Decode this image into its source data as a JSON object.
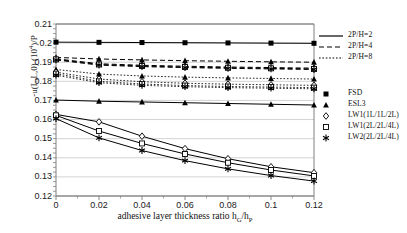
{
  "chart_data": {
    "type": "line",
    "title": "",
    "xlabel": "adhesive layer thickness ratio hG/hP",
    "ylabel": "-u(L,L,0) (10^4)/P",
    "x": [
      0,
      0.02,
      0.04,
      0.06,
      0.08,
      0.1,
      0.12
    ],
    "xlim": [
      0,
      0.12
    ],
    "ylim": [
      0.12,
      0.21
    ],
    "xticks": [
      "0",
      "0.02",
      "0.04",
      "0.06",
      "0.08",
      "0.1",
      "0.12"
    ],
    "yticks": [
      "0.21",
      "0.2",
      "0.19",
      "0.18",
      "0.17",
      "0.16",
      "0.15",
      "0.14",
      "0.13",
      "0.12"
    ],
    "grid": true,
    "legend_position": "right",
    "linestyles": [
      {
        "name": "2P/H=2",
        "dash": "solid"
      },
      {
        "name": "2P/H=4",
        "dash": "dashed"
      },
      {
        "name": "2P/H=8",
        "dash": "dotted"
      }
    ],
    "markers": [
      {
        "name": "FSD",
        "symbol": "square-filled"
      },
      {
        "name": "ESL3",
        "symbol": "triangle-filled"
      },
      {
        "name": "LW1(1L/1L/2L)",
        "symbol": "diamond-open"
      },
      {
        "name": "LW1(2L/2L/4L)",
        "symbol": "square-open"
      },
      {
        "name": "LW2(2L/2L/4L)",
        "symbol": "asterisk"
      }
    ],
    "series": [
      {
        "name": "FSD 2P/H=2",
        "dash": "solid",
        "marker": "square-filled",
        "values": [
          0.2005,
          0.2004,
          0.2003,
          0.2002,
          0.2001,
          0.2,
          0.1999
        ]
      },
      {
        "name": "ESL3 2P/H=4",
        "dash": "dashed",
        "marker": "triangle-filled",
        "values": [
          0.1925,
          0.1917,
          0.1912,
          0.1908,
          0.1905,
          0.1902,
          0.19
        ]
      },
      {
        "name": "LW1(1L/1L/2L) 2P/H=4",
        "dash": "dashed",
        "marker": "diamond-open",
        "values": [
          0.1918,
          0.1892,
          0.1884,
          0.1879,
          0.1875,
          0.1872,
          0.1869
        ]
      },
      {
        "name": "LW1(2L/2L/4L) 2P/H=4",
        "dash": "dashed",
        "marker": "square-open",
        "values": [
          0.1915,
          0.1888,
          0.188,
          0.1875,
          0.1871,
          0.1868,
          0.1865
        ]
      },
      {
        "name": "LW2(2L/2L/4L) 2P/H=4",
        "dash": "dashed",
        "marker": "asterisk",
        "values": [
          0.1912,
          0.1885,
          0.1877,
          0.1872,
          0.1868,
          0.1865,
          0.1862
        ]
      },
      {
        "name": "ESL3 2P/H=8",
        "dash": "dotted",
        "marker": "triangle-filled",
        "values": [
          0.1862,
          0.1838,
          0.1828,
          0.1822,
          0.1818,
          0.1815,
          0.1812
        ]
      },
      {
        "name": "LW1(1L/1L/2L) 2P/H=8",
        "dash": "dotted",
        "marker": "diamond-open",
        "values": [
          0.1848,
          0.1812,
          0.1798,
          0.179,
          0.1785,
          0.1782,
          0.1779
        ]
      },
      {
        "name": "LW1(2L/2L/4L) 2P/H=8",
        "dash": "dotted",
        "marker": "square-open",
        "values": [
          0.184,
          0.18,
          0.1786,
          0.1778,
          0.1773,
          0.177,
          0.1767
        ]
      },
      {
        "name": "LW2(2L/2L/4L) 2P/H=8",
        "dash": "dotted",
        "marker": "asterisk",
        "values": [
          0.1832,
          0.1793,
          0.1779,
          0.1772,
          0.1767,
          0.1764,
          0.1761
        ]
      },
      {
        "name": "ESL3 2P/H=2 lower",
        "dash": "solid",
        "marker": "triangle-filled",
        "values": [
          0.1702,
          0.1696,
          0.1692,
          0.1688,
          0.1684,
          0.168,
          0.1676
        ]
      },
      {
        "name": "LW1(1L/1L/2L) 2P/H=2",
        "dash": "solid",
        "marker": "diamond-open",
        "values": [
          0.1627,
          0.1588,
          0.1513,
          0.1448,
          0.1395,
          0.1353,
          0.1322
        ]
      },
      {
        "name": "LW1(2L/2L/4L) 2P/H=2",
        "dash": "solid",
        "marker": "square-open",
        "values": [
          0.1622,
          0.154,
          0.1475,
          0.142,
          0.1374,
          0.1336,
          0.1305
        ]
      },
      {
        "name": "LW2(2L/2L/4L) 2P/H=2",
        "dash": "solid",
        "marker": "asterisk",
        "values": [
          0.1605,
          0.1504,
          0.1438,
          0.1385,
          0.1342,
          0.1307,
          0.1278
        ]
      }
    ]
  },
  "axes": {
    "ylabel_main": "-u(L,L,0) (10",
    "ylabel_exp": "4",
    "ylabel_tail": ")/P",
    "xlabel_main": "adhesive layer thickness ratio h",
    "xlabel_sub1": "G",
    "xlabel_mid": "/h",
    "xlabel_sub2": "P"
  },
  "legend": {
    "linestyle_entries": [
      {
        "label": "2P/H=2",
        "dash": "solid"
      },
      {
        "label": "2P/H=4",
        "dash": "dashed"
      },
      {
        "label": "2P/H=8",
        "dash": "dotted"
      }
    ],
    "marker_entries": [
      {
        "label": "FSD",
        "symbol": "square-filled"
      },
      {
        "label": "ESL3",
        "symbol": "triangle-filled"
      },
      {
        "label": "LW1(1L/1L/2L)",
        "symbol": "diamond-open"
      },
      {
        "label": "LW1(2L/2L/4L)",
        "symbol": "square-open"
      },
      {
        "label": "LW2(2L/2L/4L)",
        "symbol": "asterisk"
      }
    ]
  },
  "colors": {
    "line": "#000000",
    "grid": "#c8c8c8",
    "axis": "#808080",
    "text": "#111111"
  }
}
